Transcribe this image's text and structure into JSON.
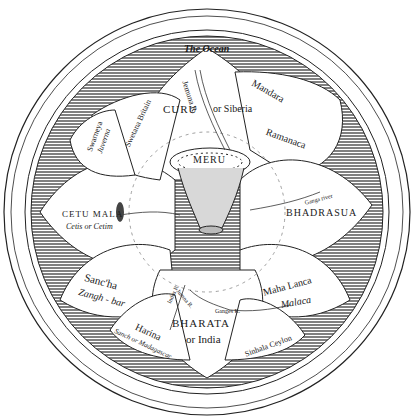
{
  "image": {
    "kind": "engraved cosmological map",
    "subject": "Mount Meru surrounded by lotus-petal continents",
    "colors": {
      "ink": "#1a1a1a",
      "paper": "#ffffff",
      "hatch": "#555555"
    }
  },
  "labels": {
    "ocean": "The Ocean",
    "north": {
      "name": "CURU",
      "alt": "or Siberia"
    },
    "north_river": "Jemuna R.",
    "mandara": "Mandara",
    "ramanaca": "Ramanaca",
    "center": "MERU",
    "east": {
      "name": "BHADRASUA"
    },
    "east_river": "Ganga river",
    "west": {
      "name": "CETU MALA",
      "alt": "Cetis or Cetim"
    },
    "west_lake": "Lake",
    "sancha": {
      "name": "Sanc'ha",
      "alt": "Zangh - bar"
    },
    "mahalanca": {
      "name": "Maha Lanca",
      "alt": "Malaca"
    },
    "south": {
      "name": "BHARATA",
      "alt": "or India"
    },
    "indus": "Indus R.",
    "jumna_s": "Jumna R.",
    "ganges": "Ganges R.",
    "harina": "Harina",
    "madagascar": "Sanch or Madagascar",
    "sinhala": "Sinhala Ceylon",
    "swarneya": {
      "name": "Swarneya",
      "alt": "Juverna"
    },
    "swetana": "Swetana Britain"
  }
}
